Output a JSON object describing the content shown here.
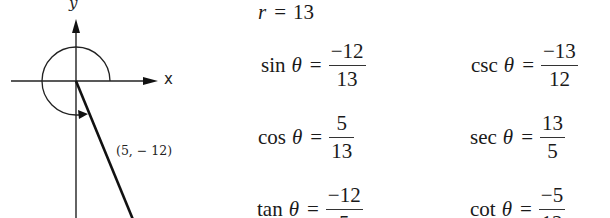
{
  "diagram": {
    "x_axis_label": "x",
    "y_axis_label": "y",
    "point_label": "(5, − 12)",
    "point": {
      "x": 5,
      "y": -12
    },
    "icons": {
      "x_axis": "arrow-right-icon",
      "y_axis": "arrow-up-icon",
      "angle_arc": "rotation-arc-icon"
    }
  },
  "equations": {
    "r": {
      "variable": "r",
      "equals": "=",
      "value": "13"
    },
    "sin": {
      "fn": "sin",
      "theta": "θ",
      "equals": "=",
      "numerator": "−12",
      "denominator": "13"
    },
    "csc": {
      "fn": "csc",
      "theta": "θ",
      "equals": "=",
      "numerator": "−13",
      "denominator": "12"
    },
    "cos": {
      "fn": "cos",
      "theta": "θ",
      "equals": "=",
      "numerator": "5",
      "denominator": "13"
    },
    "sec": {
      "fn": "sec",
      "theta": "θ",
      "equals": "=",
      "numerator": "13",
      "denominator": "5"
    },
    "tan": {
      "fn": "tan",
      "theta": "θ",
      "equals": "=",
      "numerator": "−12",
      "denominator": "5"
    },
    "cot": {
      "fn": "cot",
      "theta": "θ",
      "equals": "=",
      "numerator": "−5",
      "denominator": "12"
    }
  }
}
